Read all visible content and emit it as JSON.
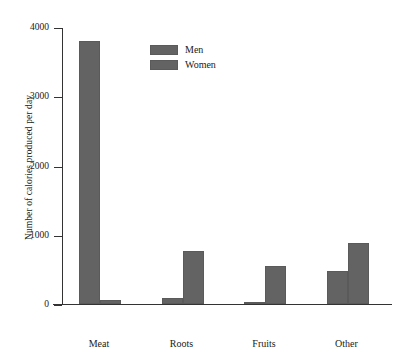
{
  "chart_data": {
    "type": "bar",
    "title": "",
    "subtitle": "",
    "xlabel": "",
    "ylabel": "Number of calories produced per day",
    "categories": [
      "Meat",
      "Roots",
      "Fruits",
      "Other"
    ],
    "series": [
      {
        "name": "Men",
        "values": [
          3800,
          85,
          30,
          470
        ]
      },
      {
        "name": "Women",
        "values": [
          55,
          760,
          550,
          875
        ]
      }
    ],
    "ylim": [
      0,
      4000
    ],
    "yticks": [
      0,
      1000,
      2000,
      3000,
      4000
    ],
    "ytick_labels": [
      "0",
      "1000",
      "2000",
      "3000",
      "4000"
    ],
    "grid": false,
    "legend_position": "upper-center-left",
    "colors": {
      "men": "#636363",
      "women": "#636363",
      "axis": "#333333",
      "background": "#ffffff",
      "text": "#1a1a1a"
    }
  }
}
